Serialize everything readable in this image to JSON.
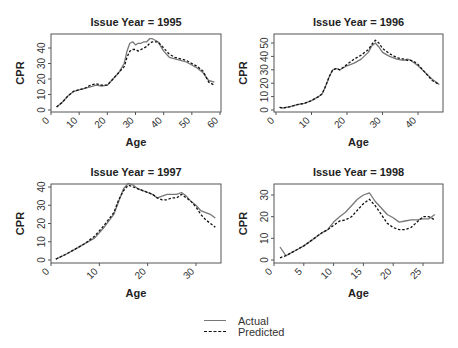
{
  "chart_data": [
    {
      "type": "line",
      "title": "Issue Year = 1995",
      "xlabel": "Age",
      "ylabel": "CPR",
      "xlim": [
        0,
        60
      ],
      "ylim": [
        0,
        47
      ],
      "xticks": [
        0,
        10,
        20,
        30,
        40,
        50,
        60
      ],
      "yticks": [
        0,
        10,
        20,
        30,
        40
      ],
      "grid": false,
      "series": [
        {
          "name": "Actual",
          "x": [
            2,
            4,
            6,
            8,
            10,
            12,
            14,
            16,
            18,
            20,
            22,
            24,
            26,
            27,
            28,
            29,
            30,
            31,
            32,
            33,
            34,
            35,
            36,
            37,
            38,
            40,
            42,
            44,
            46,
            48,
            50,
            52,
            54,
            56,
            58
          ],
          "y": [
            2,
            5,
            9,
            12,
            13,
            14,
            15,
            16,
            15.5,
            16,
            20,
            24,
            30,
            38,
            43,
            44,
            42,
            43,
            43,
            44,
            44,
            46,
            46,
            45,
            44,
            38,
            34,
            33,
            32,
            31,
            29,
            27,
            24,
            19,
            18
          ]
        },
        {
          "name": "Predicted",
          "x": [
            2,
            4,
            6,
            8,
            10,
            12,
            14,
            16,
            18,
            20,
            22,
            24,
            26,
            27,
            28,
            29,
            30,
            31,
            32,
            33,
            34,
            35,
            36,
            37,
            38,
            40,
            42,
            44,
            46,
            48,
            50,
            52,
            54,
            56,
            58
          ],
          "y": [
            2,
            5,
            9,
            12,
            13,
            14,
            16,
            17,
            16,
            16,
            20,
            24,
            28,
            34,
            38,
            39,
            39,
            38,
            39,
            40,
            41,
            43,
            44,
            44,
            44,
            40,
            36,
            34,
            33,
            32,
            30,
            28,
            25,
            18,
            16
          ]
        }
      ]
    },
    {
      "type": "line",
      "title": "Issue Year = 1996",
      "xlabel": "Age",
      "ylabel": "CPR",
      "xlim": [
        0,
        47
      ],
      "ylim": [
        0,
        52
      ],
      "xticks": [
        0,
        10,
        20,
        30,
        40
      ],
      "yticks": [
        0,
        10,
        20,
        30,
        40,
        50
      ],
      "grid": false,
      "series": [
        {
          "name": "Actual",
          "x": [
            1,
            2,
            4,
            6,
            8,
            10,
            12,
            13,
            14,
            15,
            16,
            17,
            18,
            20,
            22,
            24,
            26,
            27,
            28,
            29,
            30,
            32,
            34,
            36,
            37,
            38,
            39,
            40,
            42,
            44,
            46
          ],
          "y": [
            2,
            1.5,
            2.5,
            4,
            5,
            7,
            10,
            12,
            18,
            25,
            30,
            31,
            30,
            33,
            35,
            38,
            43,
            48,
            50,
            47,
            43,
            40,
            38,
            37,
            38,
            37,
            35,
            33,
            28,
            23,
            19
          ]
        },
        {
          "name": "Predicted",
          "x": [
            1,
            2,
            4,
            6,
            8,
            10,
            12,
            13,
            14,
            15,
            16,
            17,
            18,
            20,
            22,
            24,
            26,
            27,
            28,
            29,
            30,
            32,
            34,
            36,
            37,
            38,
            39,
            40,
            42,
            44,
            46
          ],
          "y": [
            2,
            1.5,
            2.5,
            4,
            5,
            7,
            10,
            12,
            18,
            25,
            30,
            31,
            30,
            34,
            38,
            41,
            45,
            49,
            52,
            50,
            46,
            42,
            39,
            38,
            37,
            37,
            36,
            34,
            28,
            22,
            19
          ]
        }
      ]
    },
    {
      "type": "line",
      "title": "Issue Year = 1997",
      "xlabel": "Age",
      "ylabel": "CPR",
      "xlim": [
        0,
        35
      ],
      "ylim": [
        0,
        42
      ],
      "xticks": [
        0,
        10,
        20,
        30
      ],
      "yticks": [
        0,
        10,
        20,
        30,
        40
      ],
      "grid": false,
      "series": [
        {
          "name": "Actual",
          "x": [
            1,
            3,
            5,
            7,
            9,
            11,
            13,
            14,
            15,
            16,
            17,
            18,
            19,
            20,
            21,
            22,
            23,
            24,
            25,
            26,
            27,
            28,
            29,
            30,
            31,
            32,
            33,
            34
          ],
          "y": [
            0.5,
            3,
            6,
            9,
            12,
            18,
            25,
            32,
            39,
            42,
            41,
            39,
            38,
            37,
            36,
            34,
            35,
            36,
            36,
            36,
            37,
            35,
            32,
            30,
            27,
            26,
            25,
            23
          ]
        },
        {
          "name": "Predicted",
          "x": [
            1,
            3,
            5,
            7,
            9,
            11,
            13,
            14,
            15,
            16,
            17,
            18,
            19,
            20,
            21,
            22,
            23,
            24,
            25,
            26,
            27,
            28,
            29,
            30,
            31,
            32,
            33,
            34
          ],
          "y": [
            0.5,
            3,
            6,
            9,
            13,
            19,
            26,
            33,
            38,
            41,
            40,
            39,
            38,
            37,
            36,
            34,
            33,
            33,
            34,
            34,
            36,
            34,
            32,
            29,
            25,
            22,
            20,
            18
          ]
        }
      ]
    },
    {
      "type": "line",
      "title": "Issue Year = 1998",
      "xlabel": "Age",
      "ylabel": "CPR",
      "xlim": [
        0,
        27.5
      ],
      "ylim": [
        0,
        31
      ],
      "xticks": [
        0,
        5,
        10,
        15,
        20,
        25
      ],
      "yticks": [
        0,
        10,
        20,
        30
      ],
      "grid": false,
      "series": [
        {
          "name": "Actual",
          "x": [
            1,
            2,
            3,
            4,
            5,
            6,
            7,
            8,
            9,
            10,
            11,
            12,
            13,
            14,
            15,
            16,
            17,
            18,
            19,
            20,
            21,
            22,
            23,
            24,
            25,
            26,
            27
          ],
          "y": [
            6,
            2,
            3.5,
            5,
            6.5,
            8.5,
            10.5,
            12.5,
            14,
            17.5,
            20,
            22,
            25,
            28,
            30,
            31,
            27,
            24,
            21,
            19.5,
            17.5,
            18,
            18.5,
            18.5,
            19,
            19,
            21
          ]
        },
        {
          "name": "Predicted",
          "x": [
            1,
            2,
            3,
            4,
            5,
            6,
            7,
            8,
            9,
            10,
            11,
            12,
            13,
            14,
            15,
            16,
            17,
            18,
            19,
            20,
            21,
            22,
            23,
            24,
            25,
            26,
            27
          ],
          "y": [
            1,
            2,
            3.5,
            5,
            6.5,
            8.5,
            10.5,
            12.5,
            14,
            16,
            18,
            18.5,
            20,
            23,
            26,
            28,
            25,
            21,
            17,
            15,
            14,
            14,
            15,
            17.5,
            20,
            20,
            18.5
          ]
        }
      ]
    }
  ],
  "legend": {
    "items": [
      {
        "label": "Actual",
        "style": "solid",
        "color": "#777777"
      },
      {
        "label": "Predicted",
        "style": "dashed",
        "color": "#111111"
      }
    ]
  }
}
